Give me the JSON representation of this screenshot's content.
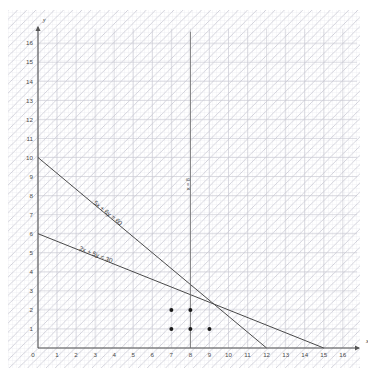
{
  "chart_data": {
    "type": "line",
    "title": "",
    "xlabel": "x",
    "ylabel": "y",
    "xlim": [
      0,
      16.8
    ],
    "ylim": [
      0,
      16.8
    ],
    "grid": true,
    "grid_minor": true,
    "hatching": "diagonal-up-right",
    "x_ticks": [
      0,
      1,
      2,
      3,
      4,
      5,
      6,
      7,
      8,
      9,
      10,
      11,
      12,
      13,
      14,
      15,
      16
    ],
    "y_ticks": [
      1,
      2,
      3,
      4,
      5,
      6,
      7,
      8,
      9,
      10,
      11,
      12,
      13,
      14,
      15,
      16
    ],
    "x_tick_labels": [
      "0",
      "1",
      "2",
      "3",
      "4",
      "5",
      "6",
      "7",
      "8",
      "9",
      "10",
      "11",
      "12",
      "13",
      "14",
      "15",
      "16"
    ],
    "y_tick_labels": [
      "1",
      "2",
      "3",
      "4",
      "5",
      "6",
      "7",
      "8",
      "9",
      "10",
      "11",
      "12",
      "13",
      "14",
      "15",
      "16"
    ],
    "series": [
      {
        "name": "5x + 6y = 60",
        "label": "5x + 6y = 60",
        "kind": "constraint-line",
        "x": [
          0,
          12
        ],
        "y": [
          10,
          0
        ],
        "intercepts": {
          "x": 12,
          "y": 10
        },
        "label_at": {
          "x": 3.6,
          "y": 7.0
        },
        "color": "#4a4a4a"
      },
      {
        "name": "2x + 5y = 30",
        "label": "2x + 5y = 30",
        "kind": "constraint-line",
        "x": [
          0,
          15
        ],
        "y": [
          6,
          0
        ],
        "intercepts": {
          "x": 15,
          "y": 6
        },
        "label_at": {
          "x": 3.0,
          "y": 4.8
        },
        "color": "#4a4a4a"
      },
      {
        "name": "x = 8",
        "label": "x = 8",
        "kind": "vertical-line",
        "x": [
          8,
          8
        ],
        "y": [
          0,
          16.6
        ],
        "label_at": {
          "x": 8.0,
          "y": 8.6
        },
        "color": "#6b6b6b"
      }
    ],
    "points": {
      "name": "lattice-points",
      "marker": "filled-circle",
      "color": "#1a1a1a",
      "values": [
        {
          "x": 7,
          "y": 2
        },
        {
          "x": 8,
          "y": 2
        },
        {
          "x": 7,
          "y": 1
        },
        {
          "x": 8,
          "y": 1
        },
        {
          "x": 9,
          "y": 1
        }
      ]
    },
    "axis_arrows": {
      "x": true,
      "y": true
    },
    "origin_label": "0"
  },
  "colors": {
    "background": "#ffffff",
    "grid_minor": "#e2e2e8",
    "grid_major": "#c6c6cf",
    "hatch": "#cfcfd8",
    "axis": "#555555",
    "line": "#4a4a4a",
    "point": "#1a1a1a",
    "text": "#4a4a4a"
  }
}
